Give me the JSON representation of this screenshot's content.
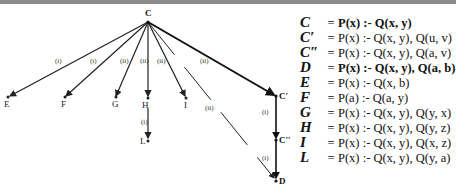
{
  "diagram": {
    "root": "C",
    "nodes": [
      {
        "id": "C",
        "label": "C",
        "x": 148,
        "y": 22
      },
      {
        "id": "E",
        "label": "E",
        "x": 8,
        "y": 99
      },
      {
        "id": "F",
        "label": "F",
        "x": 64,
        "y": 99
      },
      {
        "id": "G",
        "label": "G",
        "x": 115,
        "y": 99
      },
      {
        "id": "H",
        "label": "H",
        "x": 148,
        "y": 99
      },
      {
        "id": "I",
        "label": "I",
        "x": 186,
        "y": 99
      },
      {
        "id": "C1",
        "label": "C'",
        "x": 276,
        "y": 96
      },
      {
        "id": "C2",
        "label": "C''",
        "x": 276,
        "y": 140
      },
      {
        "id": "L",
        "label": "L",
        "x": 148,
        "y": 140
      },
      {
        "id": "D",
        "label": "D",
        "x": 276,
        "y": 180
      }
    ],
    "edges": [
      {
        "from": "C",
        "to": "E",
        "label": "(i)"
      },
      {
        "from": "C",
        "to": "F",
        "label": "(i)"
      },
      {
        "from": "C",
        "to": "G",
        "label": "(ii)"
      },
      {
        "from": "C",
        "to": "H",
        "label": "(ii)"
      },
      {
        "from": "C",
        "to": "I",
        "label": "(ii)"
      },
      {
        "from": "C",
        "to": "C1",
        "label": "(ii)",
        "style": "bold"
      },
      {
        "from": "C",
        "to": "D",
        "label": "(ii)",
        "style": "dashed"
      },
      {
        "from": "H",
        "to": "L",
        "label": "(i)"
      },
      {
        "from": "C1",
        "to": "C2",
        "label": "(i)",
        "style": "bold"
      },
      {
        "from": "C2",
        "to": "D",
        "label": "(i)",
        "style": "bold"
      }
    ]
  },
  "definitions": [
    {
      "name": "C",
      "eq": "=",
      "rule": "P(x) :- Q(x, y)",
      "bold": true
    },
    {
      "name": "C′",
      "eq": "=",
      "rule": "P(x) :- Q(x, y), Q(u, v)",
      "bold": false
    },
    {
      "name": "C″",
      "eq": "=",
      "rule": "P(x) :- Q(x, y), Q(a, v)",
      "bold": false
    },
    {
      "name": "D",
      "eq": "=",
      "rule": "P(x) :- Q(x, y), Q(a, b)",
      "bold": true
    },
    {
      "name": "E",
      "eq": "=",
      "rule": "P(x) :- Q(x, b)",
      "bold": false
    },
    {
      "name": "F",
      "eq": "=",
      "rule": "P(a) :- Q(a, y)",
      "bold": false
    },
    {
      "name": "G",
      "eq": "=",
      "rule": "P(x) :- Q(x, y), Q(y, x)",
      "bold": false
    },
    {
      "name": "H",
      "eq": "=",
      "rule": "P(x) :- Q(x, y), Q(y, z)",
      "bold": false
    },
    {
      "name": "I",
      "eq": "=",
      "rule": "P(x) :- Q(x, y), Q(x, z)",
      "bold": false
    },
    {
      "name": "L",
      "eq": "=",
      "rule": "P(x) :- Q(x, y), Q(y, a)",
      "bold": false
    }
  ]
}
